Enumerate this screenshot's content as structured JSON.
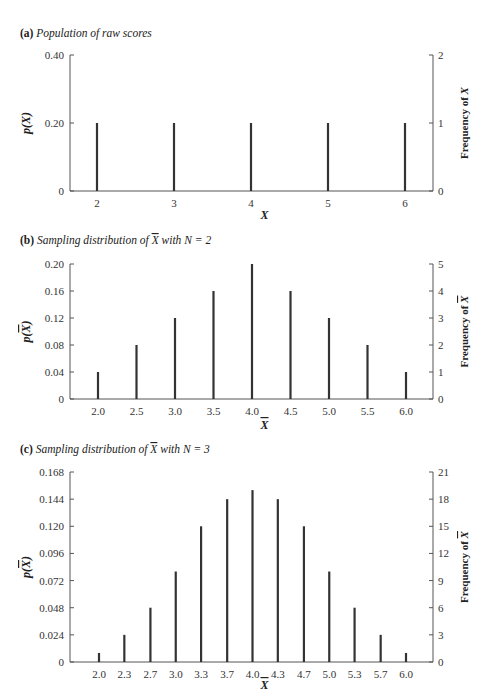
{
  "chart_data": [
    {
      "type": "bar",
      "panel_label": "(a)",
      "title": "Population of raw scores",
      "xlabel": "X",
      "ylabel": "p(X)",
      "ylabel_right": "Frequency of X",
      "categories": [
        "2",
        "3",
        "4",
        "5",
        "6"
      ],
      "x": [
        2,
        3,
        4,
        5,
        6
      ],
      "values": [
        0.2,
        0.2,
        0.2,
        0.2,
        0.2
      ],
      "frequencies": [
        1,
        1,
        1,
        1,
        1
      ],
      "ylim": [
        0,
        0.4
      ],
      "yticks": [
        "0",
        "0.20",
        "0.40"
      ],
      "yticks_right": [
        "0",
        "1",
        "2"
      ],
      "grid": false
    },
    {
      "type": "bar",
      "panel_label": "(b)",
      "title": "Sampling distribution of X̄ with N = 2",
      "xlabel": "X̄",
      "ylabel": "p(X̄)",
      "ylabel_right": "Frequency of X̄",
      "categories": [
        "2.0",
        "2.5",
        "3.0",
        "3.5",
        "4.0",
        "4.5",
        "5.0",
        "5.5",
        "6.0"
      ],
      "x": [
        2.0,
        2.5,
        3.0,
        3.5,
        4.0,
        4.5,
        5.0,
        5.5,
        6.0
      ],
      "values": [
        0.04,
        0.08,
        0.12,
        0.16,
        0.2,
        0.16,
        0.12,
        0.08,
        0.04
      ],
      "frequencies": [
        1,
        2,
        3,
        4,
        5,
        4,
        3,
        2,
        1
      ],
      "ylim": [
        0,
        0.2
      ],
      "yticks": [
        "0",
        "0.04",
        "0.08",
        "0.12",
        "0.16",
        "0.20"
      ],
      "yticks_right": [
        "0",
        "1",
        "2",
        "3",
        "4",
        "5"
      ],
      "grid": false
    },
    {
      "type": "bar",
      "panel_label": "(c)",
      "title": "Sampling distribution of X̄ with N = 3",
      "xlabel": "X̄",
      "ylabel": "p(X̄)",
      "ylabel_right": "Frequency of X̄",
      "categories": [
        "2.0",
        "2.3",
        "2.7",
        "3.0",
        "3.3",
        "3.7",
        "4.0",
        "4.3",
        "4.7",
        "5.0",
        "5.3",
        "5.7",
        "6.0"
      ],
      "x": [
        2.0,
        2.33,
        2.67,
        3.0,
        3.33,
        3.67,
        4.0,
        4.33,
        4.67,
        5.0,
        5.33,
        5.67,
        6.0
      ],
      "values": [
        0.008,
        0.024,
        0.048,
        0.08,
        0.12,
        0.144,
        0.152,
        0.144,
        0.12,
        0.08,
        0.048,
        0.024,
        0.008
      ],
      "frequencies": [
        1,
        3,
        6,
        10,
        15,
        18,
        19,
        18,
        15,
        10,
        6,
        3,
        1
      ],
      "ylim": [
        0,
        0.168
      ],
      "yticks": [
        "0",
        "0.024",
        "0.048",
        "0.072",
        "0.096",
        "0.120",
        "0.144",
        "0.168"
      ],
      "yticks_right": [
        "0",
        "3",
        "6",
        "9",
        "12",
        "15",
        "18",
        "21"
      ],
      "grid": false
    }
  ],
  "panels": [
    {
      "label": "(a)",
      "title_pre": "Population of raw scores",
      "title_bar": "",
      "title_post": ""
    },
    {
      "label": "(b)",
      "title_pre": "Sampling distribution of ",
      "title_bar": "X",
      "title_post": " with N = 2"
    },
    {
      "label": "(c)",
      "title_pre": "Sampling distribution of ",
      "title_bar": "X",
      "title_post": " with N = 3"
    }
  ],
  "colors": {
    "bar": "#333333",
    "axis": "#555555",
    "text": "#222222"
  }
}
